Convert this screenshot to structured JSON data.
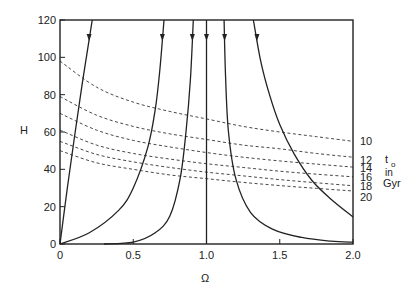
{
  "chart_data": {
    "type": "line",
    "title": "",
    "xlabel": "Ω",
    "ylabel": "H",
    "xlim": [
      0,
      2.0
    ],
    "ylim": [
      0,
      120
    ],
    "xticks": [
      0,
      0.5,
      1.0,
      1.5,
      2.0
    ],
    "xtick_labels": [
      "0",
      "0.5",
      "1.0",
      "1.5",
      "2.0"
    ],
    "yticks": [
      0,
      20,
      40,
      60,
      80,
      100,
      120
    ],
    "ytick_labels": [
      "0",
      "20",
      "40",
      "60",
      "80",
      "100",
      "120"
    ],
    "grid": false,
    "legend_title": [
      "t",
      "o",
      "in",
      "Gyr"
    ],
    "dashed_series": [
      {
        "name": "10",
        "x": [
          0,
          0.25,
          0.5,
          0.75,
          1.0,
          1.25,
          1.5,
          1.75,
          2.0
        ],
        "y": [
          98,
          84,
          76,
          71,
          67,
          63,
          60,
          57.5,
          55
        ]
      },
      {
        "name": "12",
        "x": [
          0,
          0.25,
          0.5,
          0.75,
          1.0,
          1.25,
          1.5,
          1.75,
          2.0
        ],
        "y": [
          79,
          69,
          63,
          59,
          56,
          53,
          51,
          48.5,
          46.5
        ]
      },
      {
        "name": "14",
        "x": [
          0,
          0.25,
          0.5,
          0.75,
          1.0,
          1.25,
          1.5,
          1.75,
          2.0
        ],
        "y": [
          70,
          61,
          55.5,
          52,
          49,
          46.5,
          44.5,
          42.8,
          41.2
        ]
      },
      {
        "name": "16",
        "x": [
          0,
          0.25,
          0.5,
          0.75,
          1.0,
          1.25,
          1.5,
          1.75,
          2.0
        ],
        "y": [
          61,
          53,
          48.5,
          45.5,
          43,
          41,
          39,
          37.4,
          36
        ]
      },
      {
        "name": "18",
        "x": [
          0,
          0.25,
          0.5,
          0.75,
          1.0,
          1.25,
          1.5,
          1.75,
          2.0
        ],
        "y": [
          55,
          48,
          44,
          41,
          38.5,
          36.5,
          34.5,
          32.8,
          31.2
        ]
      },
      {
        "name": "20",
        "x": [
          0,
          0.25,
          0.5,
          0.75,
          1.0,
          1.25,
          1.5,
          1.75,
          2.0
        ],
        "y": [
          50,
          43.5,
          40,
          37,
          35,
          33,
          31.3,
          29.8,
          28.4
        ]
      }
    ],
    "solid_series": [
      {
        "name": "trajectory-1",
        "x": [
          0,
          0.05,
          0.1,
          0.15,
          0.2,
          0.22
        ],
        "y": [
          0,
          30,
          58,
          85,
          110,
          120
        ]
      },
      {
        "name": "trajectory-2",
        "x": [
          0,
          0.2,
          0.4,
          0.5,
          0.6,
          0.65,
          0.68,
          0.71
        ],
        "y": [
          0,
          6,
          18,
          30,
          52,
          72,
          92,
          120
        ]
      },
      {
        "name": "trajectory-3",
        "x": [
          0.3,
          0.5,
          0.65,
          0.75,
          0.82,
          0.86,
          0.89,
          0.91
        ],
        "y": [
          0,
          1,
          6,
          15,
          35,
          60,
          88,
          120
        ]
      },
      {
        "name": "trajectory-4",
        "x": [
          1.0,
          1.0
        ],
        "y": [
          0,
          120
        ]
      },
      {
        "name": "trajectory-5",
        "x": [
          1.12,
          1.13,
          1.15,
          1.2,
          1.3,
          1.45,
          1.65,
          1.85,
          2.0
        ],
        "y": [
          120,
          90,
          60,
          35,
          17,
          8,
          3.5,
          1.5,
          1
        ]
      },
      {
        "name": "trajectory-6",
        "x": [
          1.32,
          1.37,
          1.43,
          1.5,
          1.6,
          1.72,
          1.85,
          2.0
        ],
        "y": [
          120,
          98,
          80,
          64,
          48,
          34,
          24,
          14.5
        ]
      }
    ],
    "annotations": [
      {
        "text": "10",
        "series": "10"
      },
      {
        "text": "12",
        "series": "12"
      },
      {
        "text": "14",
        "series": "14"
      },
      {
        "text": "16",
        "series": "16"
      },
      {
        "text": "18",
        "series": "18"
      },
      {
        "text": "20",
        "series": "20"
      }
    ]
  }
}
